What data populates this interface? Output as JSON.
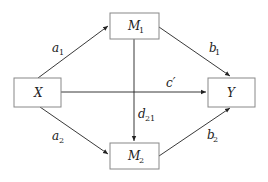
{
  "diagram": {
    "type": "mediation path diagram",
    "nodes": [
      {
        "id": "X",
        "label": "X",
        "sub": ""
      },
      {
        "id": "M1",
        "label": "M",
        "sub": "1"
      },
      {
        "id": "M2",
        "label": "M",
        "sub": "2"
      },
      {
        "id": "Y",
        "label": "Y",
        "sub": ""
      }
    ],
    "edges": [
      {
        "from": "X",
        "to": "M1",
        "label": "a",
        "sub": "1"
      },
      {
        "from": "X",
        "to": "M2",
        "label": "a",
        "sub": "2"
      },
      {
        "from": "M1",
        "to": "Y",
        "label": "b",
        "sub": "1"
      },
      {
        "from": "M2",
        "to": "Y",
        "label": "b",
        "sub": "2"
      },
      {
        "from": "X",
        "to": "Y",
        "label": "c′",
        "sub": ""
      },
      {
        "from": "M1",
        "to": "M2",
        "label": "d",
        "sub": "21"
      }
    ]
  }
}
